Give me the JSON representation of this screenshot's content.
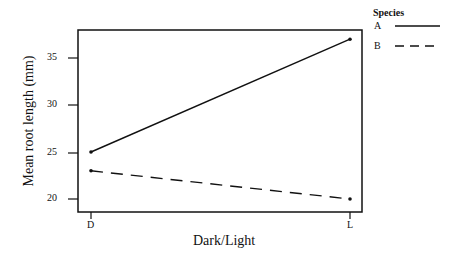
{
  "chart_data": {
    "type": "line",
    "title": "",
    "xlabel": "Dark/Light",
    "ylabel": "Mean root length (mm)",
    "categories": [
      "D",
      "L"
    ],
    "yticks": [
      20,
      25,
      30,
      35
    ],
    "ylim": [
      19,
      38
    ],
    "grid": false,
    "legend": {
      "title": "Species",
      "position": "top-right-outside"
    },
    "series": [
      {
        "name": "A",
        "style": "solid",
        "values": [
          25,
          37
        ]
      },
      {
        "name": "B",
        "style": "dashed",
        "values": [
          23,
          20
        ]
      }
    ]
  },
  "colors": {
    "line": "#111111",
    "background": "#ffffff"
  }
}
